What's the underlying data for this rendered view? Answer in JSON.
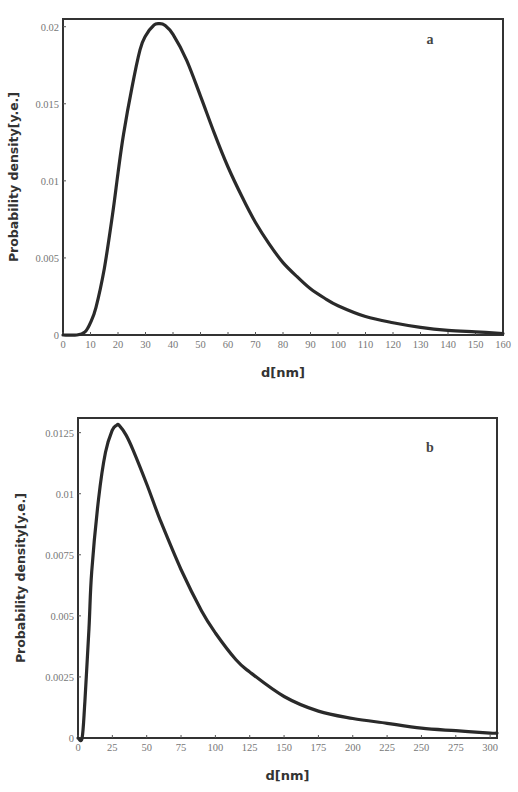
{
  "chart_data": [
    {
      "type": "line",
      "panel_label": "a",
      "title": "",
      "xlabel": "d[nm]",
      "ylabel": "Probability density[y.e.]",
      "xlim": [
        0,
        160
      ],
      "ylim": [
        0,
        0.0205
      ],
      "grid": false,
      "legend": null,
      "x_ticks": [
        "0",
        "10",
        "20",
        "30",
        "40",
        "50",
        "60",
        "70",
        "80",
        "90",
        "100",
        "110",
        "120",
        "130",
        "140",
        "150",
        "160"
      ],
      "y_ticks": [
        "0",
        "0.005",
        "0.01",
        "0.015",
        "0.02"
      ],
      "series": [
        {
          "name": "distribution a",
          "x": [
            0,
            5,
            8,
            10,
            12,
            15,
            18,
            20,
            22,
            25,
            28,
            30,
            33,
            35,
            37,
            40,
            45,
            50,
            55,
            60,
            65,
            70,
            75,
            80,
            85,
            90,
            95,
            100,
            110,
            120,
            130,
            140,
            150,
            160
          ],
          "y": [
            0,
            0,
            0.0002,
            0.0008,
            0.0018,
            0.0043,
            0.0078,
            0.0105,
            0.013,
            0.016,
            0.0185,
            0.0194,
            0.0201,
            0.0202,
            0.0201,
            0.0195,
            0.0178,
            0.0155,
            0.0131,
            0.0109,
            0.009,
            0.0073,
            0.0059,
            0.0047,
            0.0038,
            0.003,
            0.0024,
            0.0019,
            0.0012,
            0.0008,
            0.0005,
            0.0003,
            0.0002,
            0.0001
          ]
        }
      ]
    },
    {
      "type": "line",
      "panel_label": "b",
      "title": "",
      "xlabel": "d[nm]",
      "ylabel": "Probability density[y.e.]",
      "xlim": [
        0,
        305
      ],
      "ylim": [
        0,
        0.0131
      ],
      "grid": false,
      "legend": null,
      "x_ticks": [
        "0",
        "25",
        "50",
        "75",
        "100",
        "125",
        "150",
        "175",
        "200",
        "225",
        "250",
        "275",
        "300"
      ],
      "y_ticks": [
        "0",
        "0.0025",
        "0.005",
        "0.0075",
        "0.01",
        "0.0125"
      ],
      "series": [
        {
          "name": "distribution b",
          "x": [
            0,
            3,
            5,
            8,
            10,
            15,
            20,
            25,
            28,
            30,
            35,
            40,
            50,
            60,
            75,
            90,
            100,
            115,
            125,
            150,
            175,
            200,
            225,
            250,
            275,
            300,
            305
          ],
          "y": [
            0,
            0,
            0.0015,
            0.0045,
            0.0068,
            0.0098,
            0.0117,
            0.0126,
            0.0128,
            0.0128,
            0.0124,
            0.0118,
            0.0104,
            0.0089,
            0.0069,
            0.0052,
            0.0043,
            0.0032,
            0.0027,
            0.0017,
            0.0011,
            0.0008,
            0.0006,
            0.0004,
            0.0003,
            0.0002,
            0.0002
          ]
        }
      ]
    }
  ]
}
